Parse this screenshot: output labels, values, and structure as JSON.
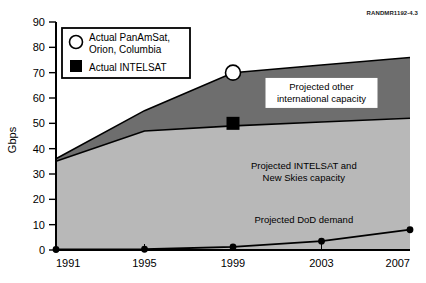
{
  "figure": {
    "rand_id": "RANDMR1192-4.3"
  },
  "chart_data": {
    "type": "area",
    "title": "",
    "xlabel": "",
    "ylabel": "Gbps",
    "x": [
      1991,
      1995,
      1999,
      2003,
      2007
    ],
    "categories": [
      "1991",
      "1995",
      "1999",
      "2003",
      "2007"
    ],
    "xlim": [
      1991,
      2007
    ],
    "ylim": [
      0,
      90
    ],
    "yticks": [
      0,
      10,
      20,
      30,
      40,
      50,
      60,
      70,
      80,
      90
    ],
    "ytick_labels": [
      "0",
      "10",
      "20",
      "30",
      "40",
      "50",
      "60",
      "70",
      "80",
      "90"
    ],
    "xtick_labels": [
      "1991",
      "1995",
      "1999",
      "2003",
      "2007"
    ],
    "grid": false,
    "stacking": "cumulative-top-boundaries",
    "series": [
      {
        "name": "Projected other international capacity",
        "kind": "area-band",
        "band_upper_name": "total international capacity",
        "color": "#6e6e6e",
        "values": [
          36,
          55,
          70,
          73,
          76
        ]
      },
      {
        "name": "Projected INTELSAT and New Skies capacity",
        "kind": "area-band",
        "color": "#b8b8b8",
        "values": [
          35,
          47,
          49,
          50.5,
          52
        ]
      },
      {
        "name": "Projected DoD demand",
        "kind": "line",
        "color": "#000000",
        "marker": "filled-circle",
        "values": [
          0.2,
          0.3,
          1.2,
          3.5,
          8
        ]
      }
    ],
    "point_markers": [
      {
        "name": "Actual PanAmSat, Orion, Columbia",
        "marker": "open-circle",
        "x": 1999,
        "y": 70
      },
      {
        "name": "Actual INTELSAT",
        "marker": "filled-square",
        "x": 1999,
        "y": 50
      }
    ],
    "annotations": [
      {
        "id": "annot-other-intl",
        "lines": [
          "Projected other",
          "international capacity"
        ],
        "x": 2003.0,
        "y": 62
      },
      {
        "id": "annot-intelsat-newskies",
        "lines": [
          "Projected INTELSAT and",
          "New Skies capacity"
        ],
        "x": 2002.2,
        "y": 31
      },
      {
        "id": "annot-dod",
        "lines": [
          "Projected DoD demand"
        ],
        "x": 2002.2,
        "y": 12
      }
    ],
    "legend": {
      "position": "upper-left-inside",
      "entries": [
        {
          "marker": "open-circle",
          "lines": [
            "Actual PanAmSat,",
            "Orion, Columbia"
          ]
        },
        {
          "marker": "filled-square",
          "lines": [
            "Actual INTELSAT"
          ]
        }
      ]
    }
  }
}
